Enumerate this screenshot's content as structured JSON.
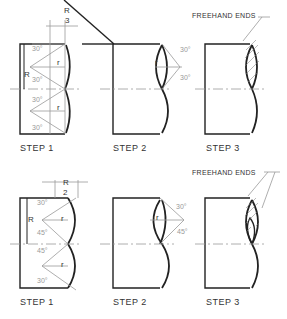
{
  "rows": [
    {
      "name": "row-top",
      "steps": [
        {
          "label": "STEP 1",
          "fraction_num": "R",
          "fraction_den": "3",
          "radius_label": "R",
          "r_label": "r",
          "angles": [
            "30°",
            "30°",
            "30°",
            "30°"
          ]
        },
        {
          "label": "STEP 2",
          "r_label": "r",
          "angles": [
            "30°",
            "30°"
          ]
        },
        {
          "label": "STEP 3",
          "note": "FREEHAND ENDS"
        }
      ]
    },
    {
      "name": "row-bottom",
      "steps": [
        {
          "label": "STEP 1",
          "fraction_num": "R",
          "fraction_den": "2",
          "radius_label": "R",
          "r_label": "r",
          "angles": [
            "30°",
            "45°",
            "45°",
            "30°"
          ]
        },
        {
          "label": "STEP 2",
          "r_label": "r",
          "angles": [
            "30°",
            "45°"
          ]
        },
        {
          "label": "STEP 3",
          "note": "FREEHAND ENDS"
        }
      ]
    }
  ],
  "colors": {
    "line": "#222222",
    "construction": "#aaaaaa"
  }
}
